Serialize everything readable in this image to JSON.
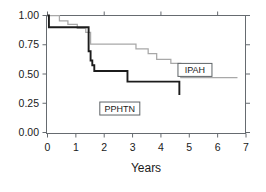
{
  "chart_data": {
    "type": "line",
    "title": "",
    "subtitle": "",
    "xlabel": "Years",
    "ylabel": "",
    "xlim": [
      0,
      7
    ],
    "ylim": [
      0.0,
      1.0
    ],
    "xticks": [
      0,
      1,
      2,
      3,
      4,
      5,
      6,
      7
    ],
    "xticklabels": [
      "0",
      "1",
      "2",
      "3",
      "4",
      "5",
      "6",
      "7"
    ],
    "yticks": [
      0.0,
      0.25,
      0.5,
      0.75,
      1.0
    ],
    "yticklabels": [
      "0.00",
      "0.25",
      "0.50",
      "0.75",
      "1.00"
    ],
    "grid": false,
    "legend_position": "inline-annotations",
    "step_style": "post",
    "series": [
      {
        "name": "PPHTN",
        "color": "#1c1c1c",
        "linewidth": 1.9,
        "annotation": "PPHTN",
        "annotation_x": 2.55,
        "annotation_y": 0.205,
        "x": [
          0.0,
          0.05,
          1.38,
          1.45,
          1.52,
          1.58,
          1.65,
          2.28,
          2.82,
          4.65
        ],
        "y": [
          1.0,
          0.9,
          0.9,
          0.695,
          0.615,
          0.575,
          0.525,
          0.525,
          0.435,
          0.32
        ]
      },
      {
        "name": "IPAH",
        "color": "#a8a8a8",
        "linewidth": 1.25,
        "annotation": "IPAH",
        "annotation_x": 5.2,
        "annotation_y": 0.535,
        "x": [
          0.0,
          0.42,
          0.72,
          1.05,
          1.35,
          1.52,
          3.02,
          3.12,
          3.55,
          3.85,
          4.35,
          4.7,
          6.7
        ],
        "y": [
          1.0,
          0.955,
          0.925,
          0.89,
          0.855,
          0.755,
          0.755,
          0.715,
          0.675,
          0.625,
          0.59,
          0.47,
          0.47
        ]
      }
    ],
    "annotations": [
      {
        "label": "IPAH",
        "boxed": true
      },
      {
        "label": "PPHTN",
        "boxed": true
      }
    ]
  },
  "axes": {
    "x_title": "Years",
    "x_tick_labels": [
      "0",
      "1",
      "2",
      "3",
      "4",
      "5",
      "6",
      "7"
    ],
    "y_tick_labels": [
      "1.00",
      "0.75",
      "0.50",
      "0.25",
      "0.00"
    ]
  },
  "colors": {
    "background": "#ffffff",
    "frame": "#666b70",
    "pphtn_curve": "#1c1c1c",
    "ipah_curve": "#a8a8a8",
    "text": "#1a1a1a"
  }
}
